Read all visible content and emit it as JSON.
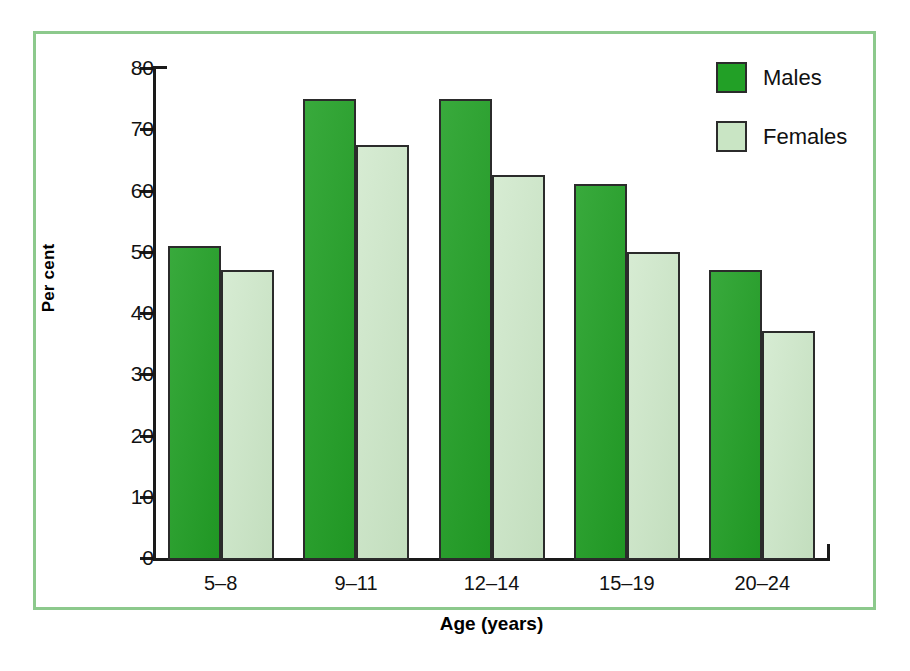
{
  "chart_data": {
    "type": "bar",
    "title": "",
    "xlabel": "Age (years)",
    "ylabel": "Per cent",
    "categories": [
      "5–8",
      "9–11",
      "12–14",
      "15–19",
      "20–24"
    ],
    "series": [
      {
        "name": "Males",
        "color": "#22a026",
        "values": [
          51,
          75,
          75,
          61,
          47
        ]
      },
      {
        "name": "Females",
        "color": "#c9e5c4",
        "values": [
          47,
          67.5,
          62.5,
          50,
          37
        ]
      }
    ],
    "ylim": [
      0,
      80
    ],
    "ytick_labels": [
      "0",
      "10",
      "20",
      "30",
      "40",
      "50",
      "60",
      "70",
      "80"
    ],
    "ytick_values": [
      0,
      10,
      20,
      30,
      40,
      50,
      60,
      70,
      80
    ],
    "grid": false,
    "legend_position": "top-right"
  },
  "frame": {
    "border_color": "#8cc98c",
    "background": "#ffffff"
  },
  "axis": {
    "line_color": "#1a1a1a"
  }
}
